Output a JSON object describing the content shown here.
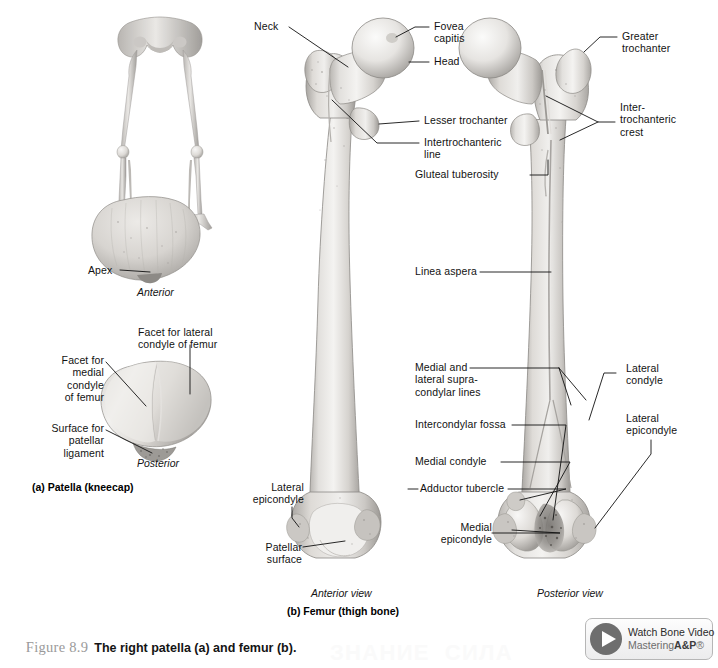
{
  "figure": {
    "number": "Figure 8.9",
    "caption_bold": "The right patella (a) and femur (b).",
    "title_full": "Figure 8.9  The right patella (a) and femur (b)."
  },
  "patella": {
    "part_label": "(a) Patella (kneecap)",
    "anterior_view": "Anterior",
    "posterior_view": "Posterior",
    "labels": {
      "apex": "Apex",
      "facet_lateral": "Facet for lateral\ncondyle of femur",
      "facet_medial": "Facet for\nmedial\ncondyle\nof femur",
      "surface_patellar": "Surface for\npatellar\nligament"
    }
  },
  "femur": {
    "part_label": "(b) Femur (thigh bone)",
    "anterior_view": "Anterior view",
    "posterior_view": "Posterior view",
    "labels": {
      "neck": "Neck",
      "fovea_capitis": "Fovea\ncapitis",
      "head": "Head",
      "greater_trochanter": "Greater\ntrochanter",
      "lesser_trochanter": "Lesser trochanter",
      "intertrochanteric_line": "Intertrochanteric\nline",
      "intertrochanteric_crest": "Inter-\ntrochanteric\ncrest",
      "gluteal_tuberosity": "Gluteal tuberosity",
      "linea_aspera": "Linea aspera",
      "supracondylar_lines": "Medial and\nlateral supra-\ncondylar lines",
      "lateral_condyle": "Lateral\ncondyle",
      "lateral_epicondyle_right": "Lateral\nepicondyle",
      "intercondylar_fossa": "Intercondylar fossa",
      "medial_condyle": "Medial condyle",
      "adductor_tubercle": "Adductor tubercle",
      "medial_epicondyle": "Medial\nepicondyle",
      "lateral_epicondyle_left": "Lateral\nepicondyle",
      "patellar_surface": "Patellar\nsurface"
    }
  },
  "video_button": {
    "line1": "Watch Bone Video",
    "line2_prefix": "Mastering",
    "line2_brand": "A&P",
    "line2_suffix": "®",
    "icon": "play-icon"
  },
  "watermark": {
    "bottom": "ЗНАНИЕ  СИЛА",
    "top": ""
  },
  "colors": {
    "bone_light": "#f2f0ee",
    "bone_mid": "#d8d5d1",
    "bone_shadow": "#a9a6a2",
    "leader_line": "#111111",
    "caption_gray": "#9a9a9a",
    "page_background": "#ffffff"
  }
}
